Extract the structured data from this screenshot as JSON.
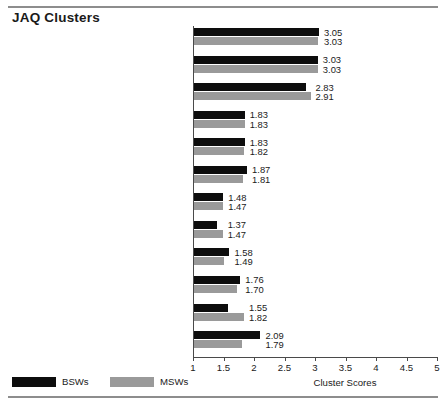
{
  "title": "JAQ Clusters",
  "chart_data": {
    "type": "bar",
    "title": "JAQ Clusters",
    "orientation": "horizontal",
    "xlabel": "Cluster Scores",
    "ylabel": "",
    "xlim": [
      1,
      5
    ],
    "xticks": [
      "1",
      "1.5",
      "2",
      "2.5",
      "3",
      "3.5",
      "4",
      "4.5",
      "5"
    ],
    "xtick_values": [
      1,
      1.5,
      2,
      2.5,
      3,
      3.5,
      4,
      4.5,
      5
    ],
    "grid": false,
    "legend_position": "bottom-left",
    "categories": [
      "15.  Delivery System Knowledge—\nSocial Services",
      "Delivery System Knowledge — Hospital",
      "Delivery System Knowledge—Outpatient",
      "16.  Program Develop.—Social Services",
      "Program Development—Hospital",
      "Program Development—Outpatient",
      "17.  Research/Policy Development—\nSocial Services",
      "Research/Policy Development—\nHospital",
      "Research/Policy Development—\nOutpatient",
      "18.  Instruction—Social Services",
      "Instruction—Hospital",
      "Instruction—Outpatient"
    ],
    "series": [
      {
        "name": "BSWs",
        "color": "#0d0d0d",
        "values": [
          3.05,
          3.03,
          2.83,
          1.83,
          1.83,
          1.87,
          1.48,
          1.37,
          1.58,
          1.76,
          1.55,
          2.09
        ],
        "labels": [
          "3.05",
          "3.03",
          "2.83",
          "1.83",
          "1.83",
          "1.87",
          "1.48",
          "1.37",
          "1.58",
          "1.76",
          "1.55",
          "2.09"
        ]
      },
      {
        "name": "MSWs",
        "color": "#9a9a9a",
        "values": [
          3.03,
          3.03,
          2.91,
          1.83,
          1.82,
          1.81,
          1.47,
          1.47,
          1.49,
          1.7,
          1.82,
          1.79
        ],
        "labels": [
          "3.03",
          "3.03",
          "2.91",
          "1.83",
          "1.82",
          "1.81",
          "1.47",
          "1.47",
          "1.49",
          "1.70",
          "1.82",
          "1.79"
        ]
      }
    ]
  },
  "legend": {
    "items": [
      {
        "label": "BSWs",
        "color": "#0d0d0d"
      },
      {
        "label": "MSWs",
        "color": "#9a9a9a"
      }
    ]
  }
}
